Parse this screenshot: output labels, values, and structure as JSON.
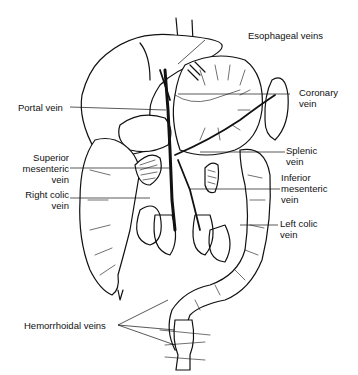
{
  "diagram": {
    "labels": {
      "esophageal": "Esophageal veins",
      "coronary": [
        "Coronary",
        "vein"
      ],
      "portal": "Portal vein",
      "splenic": [
        "Splenic",
        "vein"
      ],
      "superior_mesenteric": [
        "Superior",
        "mesenteric",
        "vein"
      ],
      "inferior_mesenteric": [
        "Inferior",
        "mesenteric",
        "vein"
      ],
      "right_colic": [
        "Right colic",
        "vein"
      ],
      "left_colic": [
        "Left colic",
        "vein"
      ],
      "hemorrhoidal": "Hemorrhoidal veins"
    }
  }
}
